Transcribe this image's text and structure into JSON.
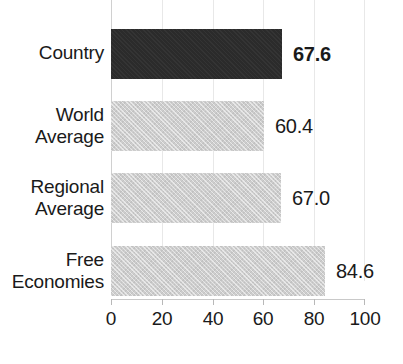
{
  "chart_data": {
    "type": "bar",
    "orientation": "horizontal",
    "title": "",
    "title_note": "title is cropped off the top edge of the screenshot",
    "xlabel": "",
    "ylabel": "",
    "categories": [
      "Country",
      "World Average",
      "Regional Average",
      "Free Economies"
    ],
    "values": [
      67.6,
      60.4,
      67.0,
      84.6
    ],
    "value_labels": [
      "67.6",
      "60.4",
      "67.0",
      "84.6"
    ],
    "xlim": [
      0,
      100
    ],
    "xticks": [
      0,
      20,
      40,
      60,
      80,
      100
    ],
    "xtick_labels": [
      "0",
      "20",
      "40",
      "60",
      "80",
      "100"
    ],
    "grid": true,
    "grid_axis": "x",
    "legend": false,
    "series": [
      {
        "name": "Score",
        "values": [
          67.6,
          60.4,
          67.0,
          84.6
        ]
      }
    ],
    "bar_colors": [
      "#2b2b2b",
      "#cdcdcd",
      "#cdcdcd",
      "#cdcdcd"
    ],
    "highlight_index": 0,
    "emphasis": {
      "label": "67.6",
      "style": "bold"
    }
  },
  "axis": {
    "ticks": [
      {
        "label": "0",
        "value": 0
      },
      {
        "label": "20",
        "value": 20
      },
      {
        "label": "40",
        "value": 40
      },
      {
        "label": "60",
        "value": 60
      },
      {
        "label": "80",
        "value": 80
      },
      {
        "label": "100",
        "value": 100
      }
    ]
  },
  "rows": [
    {
      "label_lines": [
        "Country"
      ],
      "line1": "Country",
      "line2": "",
      "value": 67.6,
      "value_label": "67.6",
      "color": "#2b2b2b",
      "bold": true
    },
    {
      "label_lines": [
        "World",
        "Average"
      ],
      "line1": "World",
      "line2": "Average",
      "value": 60.4,
      "value_label": "60.4",
      "color": "#cdcdcd",
      "bold": false
    },
    {
      "label_lines": [
        "Regional",
        "Average"
      ],
      "line1": "Regional",
      "line2": "Average",
      "value": 67.0,
      "value_label": "67.0",
      "color": "#cdcdcd",
      "bold": false
    },
    {
      "label_lines": [
        "Free",
        "Economies"
      ],
      "line1": "Free",
      "line2": "Economies",
      "value": 84.6,
      "value_label": "84.6",
      "color": "#cdcdcd",
      "bold": false
    }
  ],
  "colors": {
    "highlight_bar": "#2b2b2b",
    "default_bar": "#cdcdcd",
    "gridline": "#e8e8e8",
    "axis_line": "#c9c9c9",
    "text": "#1a1a1a",
    "background": "#ffffff"
  }
}
